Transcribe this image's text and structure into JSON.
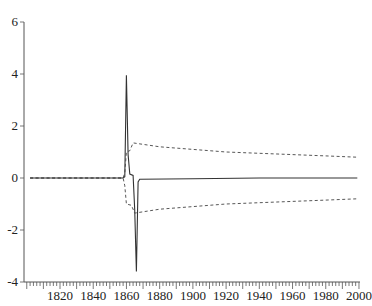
{
  "chart_data": {
    "type": "line",
    "title": "",
    "xlabel": "",
    "ylabel": "",
    "xlim": [
      1798,
      2001
    ],
    "ylim": [
      -4,
      6
    ],
    "grid": false,
    "legend": null,
    "x_ticks": [
      1820,
      1840,
      1860,
      1880,
      1900,
      1920,
      1940,
      1960,
      1980,
      2000
    ],
    "y_ticks": [
      -4,
      -2,
      0,
      2,
      4,
      6
    ],
    "series": [
      {
        "name": "response",
        "style": "solid",
        "points": [
          [
            1802,
            0
          ],
          [
            1858,
            0
          ],
          [
            1859,
            0.05
          ],
          [
            1860,
            3.95
          ],
          [
            1861,
            0.9
          ],
          [
            1862,
            0.15
          ],
          [
            1864,
            0.1
          ],
          [
            1865,
            -1.2
          ],
          [
            1866,
            -3.6
          ],
          [
            1867,
            -0.15
          ],
          [
            1868,
            -0.05
          ],
          [
            1900,
            -0.03
          ],
          [
            1940,
            0.0
          ],
          [
            1999,
            0.0
          ]
        ]
      },
      {
        "name": "upper band",
        "style": "dashed",
        "points": [
          [
            1802,
            0
          ],
          [
            1858,
            0
          ],
          [
            1859,
            0.2
          ],
          [
            1860,
            1.0
          ],
          [
            1862,
            1.05
          ],
          [
            1864,
            1.35
          ],
          [
            1880,
            1.2
          ],
          [
            1900,
            1.1
          ],
          [
            1920,
            1.0
          ],
          [
            1940,
            0.95
          ],
          [
            1960,
            0.9
          ],
          [
            1980,
            0.85
          ],
          [
            1999,
            0.8
          ]
        ]
      },
      {
        "name": "lower band",
        "style": "dashed",
        "points": [
          [
            1802,
            0
          ],
          [
            1858,
            0
          ],
          [
            1859,
            -0.3
          ],
          [
            1860,
            -1.0
          ],
          [
            1863,
            -1.05
          ],
          [
            1865,
            -1.35
          ],
          [
            1880,
            -1.2
          ],
          [
            1900,
            -1.1
          ],
          [
            1920,
            -1.0
          ],
          [
            1940,
            -0.95
          ],
          [
            1960,
            -0.9
          ],
          [
            1980,
            -0.85
          ],
          [
            1999,
            -0.8
          ]
        ]
      }
    ]
  },
  "labels": {
    "y": [
      "6",
      "4",
      "2",
      "0",
      "-2",
      "-4"
    ],
    "x": [
      "1820",
      "1840",
      "1860",
      "1880",
      "1900",
      "1920",
      "1940",
      "1960",
      "1980",
      "2000"
    ]
  }
}
